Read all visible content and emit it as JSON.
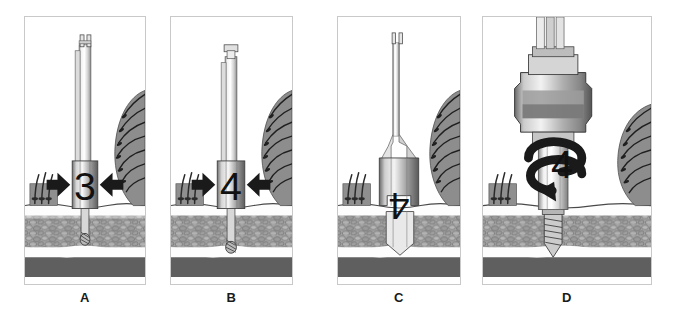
{
  "figure": {
    "panel_count": 4,
    "background_color": "#ffffff",
    "border_color": "#c9c9c9"
  },
  "colors": {
    "bone_trabecular": "#9a9a9a",
    "bone_trabecular_outline": "#5a5a5a",
    "cortical_white": "#fdfdfd",
    "deep_layer_dark": "#5f5f5f",
    "gingiva_gray": "#8f8f8f",
    "tooth_gray": "#8a8a8a",
    "metal_light": "#e8e8e8",
    "metal_mid": "#b4b4b4",
    "metal_dark": "#6e6e6e",
    "arrow_black": "#1a1a1a",
    "label_text": "#111111"
  },
  "panels": [
    {
      "id": "panel-a",
      "caption": "A",
      "step_label": "3",
      "label_orientation": "upright",
      "instrument": "twist-drill",
      "instrument_name": "narrow twist drill with depth stop",
      "arrow_type": "bidirectional-horizontal",
      "arrow_name": "width-indicator-arrows",
      "osteotomy_width": "narrow",
      "osteotomy_depth": "shallow",
      "description": "Narrow pilot drill with depth-stop collar marked 3 inserted into the crestal bone."
    },
    {
      "id": "panel-b",
      "caption": "B",
      "step_label": "4",
      "label_orientation": "upright",
      "instrument": "twist-drill",
      "instrument_name": "twist drill with wider depth stop",
      "arrow_type": "bidirectional-horizontal",
      "arrow_name": "width-indicator-arrows",
      "osteotomy_width": "narrow",
      "osteotomy_depth": "medium",
      "description": "Drill with depth-stop collar marked 4 advanced deeper into the osteotomy site."
    },
    {
      "id": "panel-c",
      "caption": "C",
      "step_label": "4",
      "label_orientation": "inverted",
      "instrument": "countersink-drill",
      "instrument_name": "wide countersink / shaping drill",
      "arrow_type": "none",
      "arrow_name": "",
      "osteotomy_width": "wide",
      "osteotomy_depth": "full",
      "description": "Wide countersink drill marked 4 shaping the final osteotomy preparation."
    },
    {
      "id": "panel-d",
      "caption": "D",
      "step_label": "4",
      "label_orientation": "upright",
      "instrument": "implant-driver-handpiece",
      "instrument_name": "contra-angle handpiece with implant driver",
      "arrow_type": "rotation-spiral",
      "arrow_name": "rotation-arrow",
      "osteotomy_width": "wide",
      "osteotomy_depth": "full",
      "description": "Threaded implant driven into the prepared osteotomy by the rotating handpiece."
    }
  ],
  "anatomy": {
    "layers": [
      {
        "name": "gingiva-surface",
        "label": "Gingiva / soft tissue surface"
      },
      {
        "name": "cortical-bone",
        "label": "Cortical bone plate"
      },
      {
        "name": "trabecular-bone",
        "label": "Trabecular (cancellous) bone"
      },
      {
        "name": "inferior-layer",
        "label": "Inferior cortical border"
      }
    ],
    "adjacent_structures": [
      {
        "name": "tooth-root-right",
        "label": "Adjacent tooth root with periodontal fibers"
      },
      {
        "name": "tooth-root-left",
        "label": "Adjacent root stub with periodontal fibers"
      }
    ]
  }
}
